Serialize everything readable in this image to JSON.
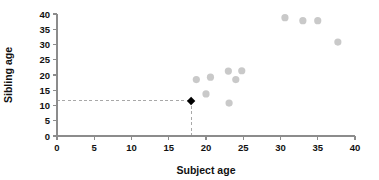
{
  "chart_data": {
    "type": "scatter",
    "title": "",
    "xlabel": "Subject age",
    "ylabel": "Sibling age",
    "xlim": [
      0,
      40
    ],
    "ylim": [
      0,
      40
    ],
    "xticks": [
      0,
      5,
      10,
      15,
      20,
      25,
      30,
      35,
      40
    ],
    "yticks": [
      0,
      5,
      10,
      15,
      20,
      25,
      30,
      35,
      40
    ],
    "grid": false,
    "legend": null,
    "series": [
      {
        "name": "sibling pairs",
        "marker": "circle",
        "color": "#c9c9c9",
        "points": [
          {
            "x": 18.7,
            "y": 18.5
          },
          {
            "x": 20.0,
            "y": 13.8
          },
          {
            "x": 20.6,
            "y": 19.3
          },
          {
            "x": 23.0,
            "y": 21.3
          },
          {
            "x": 23.1,
            "y": 10.8
          },
          {
            "x": 24.0,
            "y": 18.5
          },
          {
            "x": 24.8,
            "y": 21.4
          },
          {
            "x": 30.6,
            "y": 38.8
          },
          {
            "x": 33.0,
            "y": 37.8
          },
          {
            "x": 35.0,
            "y": 37.8
          },
          {
            "x": 37.7,
            "y": 30.8
          }
        ]
      },
      {
        "name": "highlighted subject",
        "marker": "diamond",
        "color": "#000000",
        "points": [
          {
            "x": 18.0,
            "y": 11.5
          }
        ]
      }
    ],
    "annotations": [
      {
        "type": "guide-line",
        "orientation": "horizontal",
        "from": {
          "x": 0,
          "y": 11.5
        },
        "to": {
          "x": 18.0,
          "y": 11.5
        },
        "style": "dashed",
        "color": "#a8a8a8"
      },
      {
        "type": "guide-line",
        "orientation": "vertical",
        "from": {
          "x": 18.0,
          "y": 0
        },
        "to": {
          "x": 18.0,
          "y": 11.5
        },
        "style": "dashed",
        "color": "#a8a8a8"
      }
    ]
  },
  "axes": {
    "x_title": "Subject age",
    "y_title": "Sibling age",
    "x_tick_labels": [
      "0",
      "5",
      "10",
      "15",
      "20",
      "25",
      "30",
      "35",
      "40"
    ],
    "y_tick_labels": [
      "0",
      "5",
      "10",
      "15",
      "20",
      "25",
      "30",
      "35",
      "40"
    ]
  },
  "colors": {
    "point": "#c9c9c9",
    "highlight": "#000000",
    "axis": "#8c8c8c",
    "guide": "#a8a8a8",
    "text": "#111111",
    "background": "#ffffff"
  }
}
